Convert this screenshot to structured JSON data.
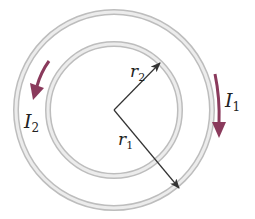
{
  "diagram": {
    "type": "concentric-current-loops",
    "center": {
      "x": 114,
      "y": 110
    },
    "rings": [
      {
        "name": "outer",
        "radius": 98,
        "current_label": "I",
        "current_sub": "1",
        "radius_label": "r",
        "radius_sub": "1",
        "current_direction": "clockwise"
      },
      {
        "name": "inner",
        "radius": 66,
        "current_label": "I",
        "current_sub": "2",
        "radius_label": "r",
        "radius_sub": "2",
        "current_direction": "counterclockwise"
      }
    ],
    "labels": {
      "I1_main": "I",
      "I1_sub": "1",
      "I2_main": "I",
      "I2_sub": "2",
      "r1_main": "r",
      "r1_sub": "1",
      "r2_main": "r",
      "r2_sub": "2"
    },
    "colors": {
      "ring": "#cfcfcf",
      "ring_edge": "#b5b5b5",
      "current_arrow": "#8a3a5c",
      "radius_arrow": "#333333",
      "text": "#222222"
    }
  }
}
